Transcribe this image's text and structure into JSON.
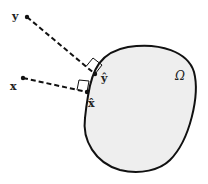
{
  "diagram": {
    "region_label": "Ω",
    "points": [
      {
        "id": "y",
        "label": "y",
        "projection_label": "ŷ"
      },
      {
        "id": "x",
        "label": "x",
        "projection_label": "x̂"
      }
    ],
    "colors": {
      "region_fill": "#eeeeee",
      "stroke": "#111111",
      "text": "#222222"
    },
    "connector_style": "dashed",
    "right_angle_markers": true
  }
}
